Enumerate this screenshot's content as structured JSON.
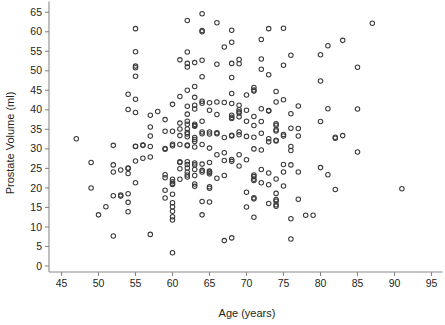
{
  "chart_data": {
    "type": "scatter",
    "title": "",
    "xlabel": "Age (years)",
    "ylabel": "Prostate Volume (ml)",
    "xlim": [
      44.0,
      96.5
    ],
    "ylim": [
      -1.0,
      67.0
    ],
    "xticks": [
      45,
      50,
      55,
      60,
      65,
      70,
      75,
      80,
      85,
      90,
      95
    ],
    "yticks": [
      0,
      5,
      10,
      15,
      20,
      25,
      30,
      35,
      40,
      45,
      50,
      55,
      60,
      65
    ],
    "xtick_labels": [
      "45",
      "50",
      "55",
      "60",
      "65",
      "70",
      "75",
      "80",
      "85",
      "90",
      "95"
    ],
    "ytick_labels": [
      "0",
      "5",
      "10",
      "15",
      "20",
      "25",
      "30",
      "35",
      "40",
      "45",
      "50",
      "55",
      "60",
      "65"
    ],
    "grid": false,
    "legend": null,
    "marker": "open-circle",
    "marker_color": "#3a3a3c",
    "background_color": "#ffffff",
    "axis_color": "#8a8a8a",
    "n_points": 253,
    "series": [
      {
        "name": "subjects",
        "points": [
          [
            47.0,
            32.6
          ],
          [
            49.0,
            26.5
          ],
          [
            49.0,
            20.0
          ],
          [
            50.0,
            13.1
          ],
          [
            51.0,
            15.2
          ],
          [
            52.0,
            30.9
          ],
          [
            52.0,
            25.9
          ],
          [
            52.0,
            24.1
          ],
          [
            52.0,
            18.0
          ],
          [
            52.0,
            7.7
          ],
          [
            53.0,
            24.6
          ],
          [
            53.0,
            18.2
          ],
          [
            53.0,
            17.9
          ],
          [
            54.0,
            44.0
          ],
          [
            54.0,
            40.1
          ],
          [
            54.0,
            25.1
          ],
          [
            54.0,
            25.0
          ],
          [
            54.0,
            23.7
          ],
          [
            54.0,
            18.5
          ],
          [
            54.0,
            16.3
          ],
          [
            54.0,
            13.9
          ],
          [
            55.0,
            60.8
          ],
          [
            55.0,
            54.9
          ],
          [
            55.0,
            51.2
          ],
          [
            55.0,
            50.8
          ],
          [
            55.0,
            48.6
          ],
          [
            55.0,
            42.7
          ],
          [
            55.0,
            39.3
          ],
          [
            55.0,
            30.7
          ],
          [
            55.0,
            30.6
          ],
          [
            55.0,
            26.9
          ],
          [
            55.0,
            21.3
          ],
          [
            56.0,
            31.0
          ],
          [
            56.0,
            30.9
          ],
          [
            56.0,
            27.6
          ],
          [
            57.0,
            38.6
          ],
          [
            57.0,
            35.6
          ],
          [
            57.0,
            33.3
          ],
          [
            57.0,
            30.6
          ],
          [
            57.0,
            27.9
          ],
          [
            57.0,
            8.1
          ],
          [
            58.0,
            39.6
          ],
          [
            59.0,
            37.5
          ],
          [
            59.0,
            34.5
          ],
          [
            59.0,
            30.1
          ],
          [
            59.0,
            29.9
          ],
          [
            59.0,
            23.4
          ],
          [
            59.0,
            22.6
          ],
          [
            59.0,
            19.4
          ],
          [
            59.0,
            17.4
          ],
          [
            60.0,
            41.4
          ],
          [
            60.0,
            34.5
          ],
          [
            60.0,
            31.2
          ],
          [
            60.0,
            30.8
          ],
          [
            60.0,
            22.2
          ],
          [
            60.0,
            21.6
          ],
          [
            60.0,
            21.1
          ],
          [
            60.0,
            20.9
          ],
          [
            60.0,
            18.4
          ],
          [
            60.0,
            16.2
          ],
          [
            60.0,
            15.2
          ],
          [
            60.0,
            14.0
          ],
          [
            60.0,
            12.6
          ],
          [
            60.0,
            11.8
          ],
          [
            60.0,
            3.4
          ],
          [
            61.0,
            52.8
          ],
          [
            61.0,
            43.4
          ],
          [
            61.0,
            36.6
          ],
          [
            61.0,
            35.1
          ],
          [
            61.0,
            33.4
          ],
          [
            61.0,
            31.1
          ],
          [
            61.0,
            26.7
          ],
          [
            61.0,
            26.5
          ],
          [
            61.0,
            24.9
          ],
          [
            61.0,
            22.2
          ],
          [
            62.0,
            62.9
          ],
          [
            62.0,
            54.8
          ],
          [
            62.0,
            51.9
          ],
          [
            62.0,
            51.0
          ],
          [
            62.0,
            45.0
          ],
          [
            62.0,
            40.9
          ],
          [
            62.0,
            38.9
          ],
          [
            62.0,
            37.1
          ],
          [
            62.0,
            36.3
          ],
          [
            62.0,
            35.1
          ],
          [
            62.0,
            34.2
          ],
          [
            62.0,
            33.8
          ],
          [
            62.0,
            33.1
          ],
          [
            62.0,
            31.0
          ],
          [
            62.0,
            30.8
          ],
          [
            62.0,
            26.7
          ],
          [
            62.0,
            26.0
          ],
          [
            62.0,
            25.1
          ],
          [
            62.0,
            24.0
          ],
          [
            62.0,
            23.3
          ],
          [
            62.0,
            22.8
          ],
          [
            63.0,
            52.1
          ],
          [
            63.0,
            46.0
          ],
          [
            63.0,
            43.2
          ],
          [
            63.0,
            41.2
          ],
          [
            63.0,
            40.2
          ],
          [
            63.0,
            36.3
          ],
          [
            63.0,
            36.0
          ],
          [
            63.0,
            35.8
          ],
          [
            63.0,
            32.9
          ],
          [
            63.0,
            32.4
          ],
          [
            63.0,
            31.9
          ],
          [
            63.0,
            30.5
          ],
          [
            63.0,
            26.4
          ],
          [
            63.0,
            25.9
          ],
          [
            63.0,
            24.7
          ],
          [
            63.0,
            23.2
          ],
          [
            63.0,
            21.0
          ],
          [
            63.0,
            20.4
          ],
          [
            64.0,
            64.6
          ],
          [
            64.0,
            60.3
          ],
          [
            64.0,
            60.0
          ],
          [
            64.0,
            52.7
          ],
          [
            64.0,
            48.5
          ],
          [
            64.0,
            42.2
          ],
          [
            64.0,
            41.7
          ],
          [
            64.0,
            37.1
          ],
          [
            64.0,
            34.3
          ],
          [
            64.0,
            33.9
          ],
          [
            64.0,
            31.1
          ],
          [
            64.0,
            26.1
          ],
          [
            64.0,
            24.5
          ],
          [
            64.0,
            24.1
          ],
          [
            64.0,
            16.5
          ],
          [
            64.0,
            13.1
          ],
          [
            65.0,
            41.8
          ],
          [
            65.0,
            39.9
          ],
          [
            65.0,
            34.3
          ],
          [
            65.0,
            33.8
          ],
          [
            65.0,
            30.2
          ],
          [
            65.0,
            26.5
          ],
          [
            65.0,
            24.3
          ],
          [
            65.0,
            24.0
          ],
          [
            65.0,
            23.6
          ],
          [
            65.0,
            20.3
          ],
          [
            65.0,
            19.9
          ],
          [
            65.0,
            16.4
          ],
          [
            66.0,
            62.3
          ],
          [
            66.0,
            51.7
          ],
          [
            66.0,
            42.0
          ],
          [
            66.0,
            38.8
          ],
          [
            66.0,
            34.1
          ],
          [
            66.0,
            33.9
          ],
          [
            66.0,
            28.5
          ],
          [
            66.0,
            22.5
          ],
          [
            67.0,
            56.1
          ],
          [
            67.0,
            41.9
          ],
          [
            67.0,
            32.9
          ],
          [
            67.0,
            29.0
          ],
          [
            67.0,
            27.0
          ],
          [
            67.0,
            23.2
          ],
          [
            67.0,
            6.5
          ],
          [
            68.0,
            60.4
          ],
          [
            68.0,
            57.3
          ],
          [
            68.0,
            51.9
          ],
          [
            68.0,
            48.3
          ],
          [
            68.0,
            44.2
          ],
          [
            68.0,
            41.6
          ],
          [
            68.0,
            38.6
          ],
          [
            68.0,
            38.1
          ],
          [
            68.0,
            37.8
          ],
          [
            68.0,
            33.5
          ],
          [
            68.0,
            33.3
          ],
          [
            68.0,
            27.3
          ],
          [
            68.0,
            26.8
          ],
          [
            68.0,
            7.2
          ],
          [
            69.0,
            52.9
          ],
          [
            69.0,
            51.8
          ],
          [
            69.0,
            41.2
          ],
          [
            69.0,
            40.0
          ],
          [
            69.0,
            39.5
          ],
          [
            69.0,
            39.2
          ],
          [
            69.0,
            38.2
          ],
          [
            69.0,
            34.3
          ],
          [
            69.0,
            33.6
          ],
          [
            69.0,
            28.5
          ],
          [
            69.0,
            25.6
          ],
          [
            70.0,
            43.8
          ],
          [
            70.0,
            39.9
          ],
          [
            70.0,
            37.1
          ],
          [
            70.0,
            33.2
          ],
          [
            70.0,
            27.2
          ],
          [
            70.0,
            18.9
          ],
          [
            70.0,
            15.1
          ],
          [
            71.0,
            45.7
          ],
          [
            71.0,
            45.1
          ],
          [
            71.0,
            44.8
          ],
          [
            71.0,
            38.3
          ],
          [
            71.0,
            36.0
          ],
          [
            71.0,
            33.0
          ],
          [
            71.0,
            30.0
          ],
          [
            71.0,
            23.3
          ],
          [
            71.0,
            22.9
          ],
          [
            71.0,
            22.2
          ],
          [
            71.0,
            21.9
          ],
          [
            71.0,
            17.5
          ],
          [
            71.0,
            17.2
          ],
          [
            71.0,
            12.5
          ],
          [
            72.0,
            58.0
          ],
          [
            72.0,
            53.0
          ],
          [
            72.0,
            50.4
          ],
          [
            72.0,
            40.3
          ],
          [
            72.0,
            37.0
          ],
          [
            72.0,
            34.0
          ],
          [
            72.0,
            29.7
          ],
          [
            72.0,
            24.7
          ],
          [
            72.0,
            21.3
          ],
          [
            73.0,
            60.8
          ],
          [
            73.0,
            49.0
          ],
          [
            73.0,
            39.8
          ],
          [
            73.0,
            39.7
          ],
          [
            73.0,
            32.6
          ],
          [
            73.0,
            31.8
          ],
          [
            73.0,
            23.8
          ],
          [
            73.0,
            20.8
          ],
          [
            73.0,
            16.0
          ],
          [
            74.0,
            44.7
          ],
          [
            74.0,
            42.0
          ],
          [
            74.0,
            36.4
          ],
          [
            74.0,
            36.0
          ],
          [
            74.0,
            34.9
          ],
          [
            74.0,
            34.6
          ],
          [
            74.0,
            32.2
          ],
          [
            74.0,
            32.0
          ],
          [
            74.0,
            22.3
          ],
          [
            74.0,
            18.6
          ],
          [
            74.0,
            17.0
          ],
          [
            74.0,
            16.6
          ],
          [
            74.0,
            15.7
          ],
          [
            74.0,
            15.3
          ],
          [
            75.0,
            60.9
          ],
          [
            75.0,
            51.4
          ],
          [
            75.0,
            42.6
          ],
          [
            75.0,
            33.7
          ],
          [
            75.0,
            33.3
          ],
          [
            75.0,
            26.0
          ],
          [
            75.0,
            24.1
          ],
          [
            75.0,
            20.5
          ],
          [
            76.0,
            54.0
          ],
          [
            76.0,
            39.0
          ],
          [
            76.0,
            35.3
          ],
          [
            76.0,
            30.6
          ],
          [
            76.0,
            29.6
          ],
          [
            76.0,
            25.9
          ],
          [
            76.0,
            12.1
          ],
          [
            76.0,
            6.9
          ],
          [
            77.0,
            41.0
          ],
          [
            77.0,
            35.2
          ],
          [
            77.0,
            33.3
          ],
          [
            77.0,
            24.1
          ],
          [
            77.0,
            17.1
          ],
          [
            78.0,
            13.0
          ],
          [
            79.0,
            13.0
          ],
          [
            80.0,
            54.1
          ],
          [
            80.0,
            47.4
          ],
          [
            80.0,
            37.0
          ],
          [
            80.0,
            25.2
          ],
          [
            81.0,
            56.4
          ],
          [
            81.0,
            40.3
          ],
          [
            81.0,
            23.4
          ],
          [
            82.0,
            33.0
          ],
          [
            82.0,
            32.7
          ],
          [
            82.0,
            19.6
          ],
          [
            83.0,
            57.8
          ],
          [
            83.0,
            33.4
          ],
          [
            85.0,
            50.9
          ],
          [
            85.0,
            40.2
          ],
          [
            85.0,
            29.2
          ],
          [
            87.0,
            62.2
          ],
          [
            91.0,
            19.8
          ]
        ]
      }
    ]
  }
}
